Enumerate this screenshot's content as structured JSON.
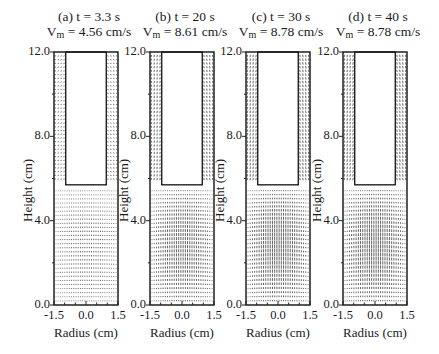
{
  "chart_data": {
    "type": "vector-field",
    "xlabel": "Radius (cm)",
    "ylabel": "Height (cm)",
    "xlim": [
      -1.5,
      1.5
    ],
    "ylim": [
      0.0,
      12.0
    ],
    "xticks": [
      "-1.5",
      "0.0",
      "1.5"
    ],
    "yticks": [
      "0.0",
      "4.0",
      "8.0",
      "12.0"
    ],
    "inner_cylinder": {
      "radius_cm": 0.95,
      "bottom_height_cm": 5.7,
      "top_height_cm": 12.0
    },
    "panels": [
      {
        "label": "(a)",
        "time": "t = 3.3 s",
        "vm_prefix": "V",
        "vm_sub": "m",
        "vm_value": " = 4.56 cm/s",
        "amplitude": 0.25
      },
      {
        "label": "(b)",
        "time": "t = 20 s",
        "vm_prefix": "V",
        "vm_sub": "m",
        "vm_value": " = 8.61 cm/s",
        "amplitude": 0.8
      },
      {
        "label": "(c)",
        "time": "t = 30 s",
        "vm_prefix": "V",
        "vm_sub": "m",
        "vm_value": " = 8.78 cm/s",
        "amplitude": 1.0
      },
      {
        "label": "(d)",
        "time": "t = 40 s",
        "vm_prefix": "V",
        "vm_sub": "m",
        "vm_value": " = 8.78 cm/s",
        "amplitude": 1.0
      }
    ]
  },
  "panels": [
    {
      "title_line1": "(a)  t = 3.3 s",
      "vm_value": " = 4.56 cm/s"
    },
    {
      "title_line1": "(b)  t = 20 s",
      "vm_value": " = 8.61 cm/s"
    },
    {
      "title_line1": "(c)  t = 30 s",
      "vm_value": " = 8.78 cm/s"
    },
    {
      "title_line1": "(d)  t = 40 s",
      "vm_value": " = 8.78 cm/s"
    }
  ],
  "axes": {
    "vm_prefix": "V",
    "vm_sub": "m",
    "xlabel": "Radius (cm)",
    "ylabel": "Height (cm)",
    "xticks": [
      "-1.5",
      "0.0",
      "1.5"
    ],
    "yticks": [
      "12.0",
      "8.0",
      "4.0",
      "0.0"
    ]
  }
}
